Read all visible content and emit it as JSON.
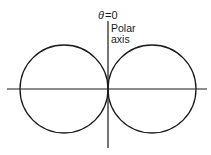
{
  "diagram": {
    "type": "polar-curve",
    "labels": {
      "theta": "θ",
      "equals_zero": "=0",
      "polar_line1": "Polar",
      "polar_line2": "axis"
    },
    "colors": {
      "stroke": "#1a1a1a",
      "background": "#ffffff"
    },
    "geometry": {
      "origin": [
        108,
        89
      ],
      "circle_radius": 44,
      "left_circle_center": [
        64,
        89
      ],
      "right_circle_center": [
        152,
        89
      ]
    }
  }
}
